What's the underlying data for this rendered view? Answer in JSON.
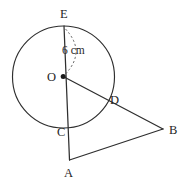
{
  "figure": {
    "name": "circle-with-secant-triangle-diagram",
    "background_color": "#ffffff",
    "stroke_color": "#2e2e2e",
    "dashed_color": "#5a5a5a",
    "label_color": "#1f1f1f"
  },
  "labels": {
    "E": "E",
    "O": "O",
    "C": "C",
    "A": "A",
    "B": "B",
    "D": "D",
    "radius": "6 cm"
  },
  "geometry": {
    "circle": {
      "cx": 63.5,
      "cy": 77,
      "r": 51
    },
    "points": {
      "E": {
        "x": 64,
        "y": 26
      },
      "O": {
        "x": 63.2,
        "y": 76.5
      },
      "C": {
        "x": 66.8,
        "y": 122
      },
      "A": {
        "x": 69.5,
        "y": 160
      },
      "B": {
        "x": 163,
        "y": 129
      },
      "D": {
        "x": 105,
        "y": 96
      }
    },
    "segments": [
      {
        "name": "EA",
        "from": "E",
        "to": "A"
      },
      {
        "name": "OB",
        "from": "O",
        "to": "B"
      },
      {
        "name": "AB",
        "from": "A",
        "to": "B"
      }
    ],
    "radius_leader": {
      "name": "radius-arc",
      "from": "E",
      "to": "O",
      "style": "dashed-arc"
    }
  },
  "label_positions": {
    "E": {
      "x": 60,
      "y": 18
    },
    "O": {
      "x": 47,
      "y": 81
    },
    "C": {
      "x": 57,
      "y": 136
    },
    "A": {
      "x": 64,
      "y": 177
    },
    "B": {
      "x": 169,
      "y": 134
    },
    "D": {
      "x": 110,
      "y": 104
    },
    "radius": {
      "x": 62,
      "y": 54
    }
  }
}
